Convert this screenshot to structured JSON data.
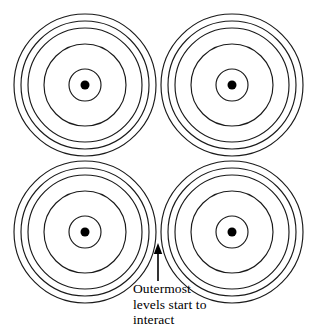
{
  "figure": {
    "background_color": "#ffffff",
    "stroke_color": "#1a1a1a",
    "dot_color": "#000000",
    "width": 318,
    "height": 336
  },
  "caption": {
    "text": "Outermost\nlevels start to\ninteract",
    "lines": [
      "Outermost",
      "levels start to",
      "interact"
    ],
    "x": 133,
    "y": 281
  },
  "arrow": {
    "name": "pointer-arrow",
    "direction": "up",
    "tip_x": 158,
    "tip_y": 243,
    "tail_x": 158,
    "tail_y": 281
  },
  "chart_data": {
    "type": "scatter",
    "xlabel": "",
    "ylabel": "",
    "xlim": [
      0,
      318
    ],
    "ylim": [
      0,
      336
    ],
    "grid": false,
    "legend": "none",
    "annotations": [
      {
        "text": "Outermost levels start to interact",
        "x": 158,
        "y": 243,
        "arrow": true
      }
    ],
    "groups": [
      {
        "name": "top-left-atom",
        "cx": 85,
        "cy": 85,
        "dot_radius": 4.5,
        "ring_radii": [
          16,
          41,
          57,
          64,
          71
        ]
      },
      {
        "name": "top-right-atom",
        "cx": 232,
        "cy": 85,
        "dot_radius": 4.5,
        "ring_radii": [
          16,
          41,
          57,
          64,
          71
        ]
      },
      {
        "name": "bottom-left-atom",
        "cx": 85,
        "cy": 232,
        "dot_radius": 4.5,
        "ring_radii": [
          16,
          41,
          57,
          64,
          71
        ]
      },
      {
        "name": "bottom-right-atom",
        "cx": 232,
        "cy": 232,
        "dot_radius": 4.5,
        "ring_radii": [
          16,
          41,
          57,
          64,
          71
        ]
      }
    ]
  }
}
